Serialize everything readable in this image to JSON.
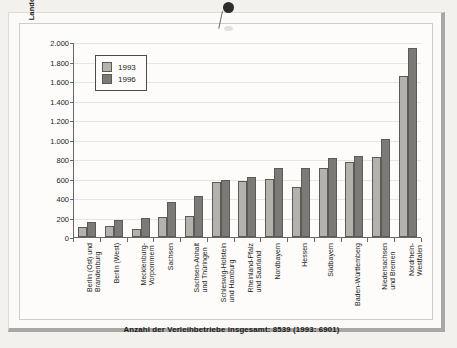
{
  "chart_data": {
    "type": "bar",
    "title": "",
    "xlabel": "",
    "ylabel": "Landesarbeitsamtsbezirke",
    "ylim": [
      0,
      2000
    ],
    "ytick_labels": [
      "2.000",
      "1.800",
      "1.600",
      "1.400",
      "1.200",
      "1.000",
      "800",
      "600",
      "400",
      "200",
      "0"
    ],
    "ytick_values": [
      2000,
      1800,
      1600,
      1400,
      1200,
      1000,
      800,
      600,
      400,
      200,
      0
    ],
    "grid": true,
    "legend_position": "upper-left-inside",
    "categories": [
      "Berlin (Ost) und Brandenburg",
      "Berlin (West)",
      "Mecklenburg-Vorpommern",
      "Sachsen",
      "Sachsen-Anhalt und Thüringen",
      "Schleswig-Holstein und Hamburg",
      "Rheinland-Pfalz und Saarland",
      "Nordbayern",
      "Hessen",
      "Südbayern",
      "Baden-Württemberg",
      "Niedersachsen und Bremen",
      "Nordrhein-Westfalen"
    ],
    "category_lines": [
      [
        "Berlin (Ost) und",
        "Brandenburg"
      ],
      [
        "Berlin (West)"
      ],
      [
        "Mecklenburg-",
        "Vorpommern"
      ],
      [
        "Sachsen"
      ],
      [
        "Sachsen-Anhalt",
        "und Thüringen"
      ],
      [
        "Schleswig-Holstein",
        "und Hamburg"
      ],
      [
        "Rheinland-Pfalz",
        "und Saarland"
      ],
      [
        "Nordbayern"
      ],
      [
        "Hessen"
      ],
      [
        "Südbayern"
      ],
      [
        "Baden-Württemberg"
      ],
      [
        "Niedersachsen",
        "und Bremen"
      ],
      [
        "Nordrhein-",
        "Westfalen"
      ]
    ],
    "series": [
      {
        "name": "1993",
        "color": "#b4b2ad",
        "values": [
          105,
          115,
          80,
          210,
          220,
          560,
          575,
          590,
          510,
          710,
          770,
          820,
          1655
        ]
      },
      {
        "name": "1996",
        "color": "#7c7a76",
        "values": [
          150,
          170,
          198,
          358,
          418,
          585,
          612,
          710,
          705,
          812,
          835,
          1010,
          1935
        ]
      }
    ],
    "footnote": "Anzahl der Verleihbetriebe insgesamt: 8539 (1993: 6901)"
  },
  "legend": {
    "items": [
      {
        "label": "1993",
        "color": "#b4b2ad"
      },
      {
        "label": "1996",
        "color": "#7c7a76"
      }
    ]
  },
  "annotations": {
    "pushpin": "pushpin-marker"
  },
  "colors": {
    "page_background": "#f2f1ee",
    "sheet_background": "#fdfcfa",
    "frame": "#a9a8a6",
    "axis": "#6a6865",
    "grid": "#e7e5e0",
    "text": "#1c1b1a",
    "series_1993": "#b4b2ad",
    "series_1996": "#7c7a76"
  }
}
